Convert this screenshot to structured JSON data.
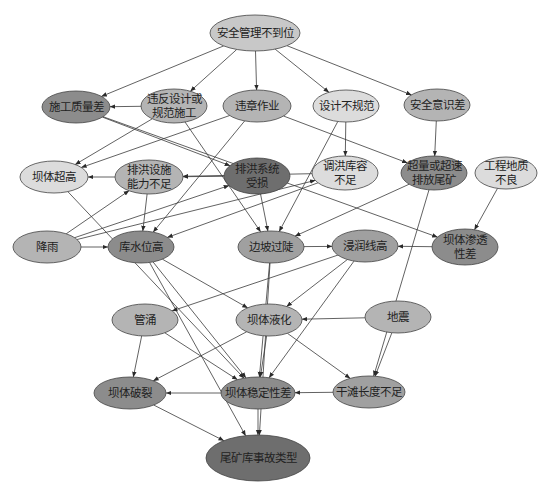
{
  "diagram": {
    "title": "",
    "colors": {
      "light": "#dcdcdc",
      "medium_light": "#c8c8c8",
      "medium": "#b4b4b4",
      "medium_dark": "#a0a0a0",
      "dark": "#8c8c8c",
      "darkest": "#6e6e6e",
      "edge": "#3a3a3a"
    },
    "nodes": [
      {
        "id": "n_safety_mgmt",
        "lines": [
          "安全管理不到位"
        ],
        "x": 255,
        "y": 33,
        "rx": 45,
        "ry": 18,
        "fill": "#c8c8c8"
      },
      {
        "id": "n_construction_quality",
        "lines": [
          "施工质量差"
        ],
        "x": 76,
        "y": 107,
        "rx": 34,
        "ry": 16,
        "fill": "#8c8c8c"
      },
      {
        "id": "n_violate_design",
        "lines": [
          "违反设计或",
          "规范施工"
        ],
        "x": 174,
        "y": 106,
        "rx": 33,
        "ry": 17,
        "fill": "#b4b4b4"
      },
      {
        "id": "n_illegal_ops",
        "lines": [
          "违章作业"
        ],
        "x": 257,
        "y": 106,
        "rx": 34,
        "ry": 16,
        "fill": "#b4b4b4"
      },
      {
        "id": "n_design_nonstandard",
        "lines": [
          "设计不规范"
        ],
        "x": 346,
        "y": 106,
        "rx": 33,
        "ry": 16,
        "fill": "#dcdcdc"
      },
      {
        "id": "n_safety_awareness",
        "lines": [
          "安全意识差"
        ],
        "x": 437,
        "y": 105,
        "rx": 33,
        "ry": 16,
        "fill": "#b4b4b4"
      },
      {
        "id": "n_dam_overheight",
        "lines": [
          "坝体超高"
        ],
        "x": 54,
        "y": 177,
        "rx": 34,
        "ry": 16,
        "fill": "#dcdcdc"
      },
      {
        "id": "n_drain_capacity",
        "lines": [
          "排洪设施",
          "能力不足"
        ],
        "x": 149,
        "y": 177,
        "rx": 34,
        "ry": 17,
        "fill": "#b4b4b4"
      },
      {
        "id": "n_drain_damaged",
        "lines": [
          "排洪系统",
          "受损"
        ],
        "x": 257,
        "y": 176,
        "rx": 33,
        "ry": 18,
        "fill": "#6e6e6e"
      },
      {
        "id": "n_flood_storage",
        "lines": [
          "调洪库容",
          "不足"
        ],
        "x": 345,
        "y": 173,
        "rx": 33,
        "ry": 17,
        "fill": "#dcdcdc"
      },
      {
        "id": "n_over_discharge",
        "lines": [
          "超量或超速",
          "排放尾矿"
        ],
        "x": 434,
        "y": 173,
        "rx": 33,
        "ry": 17,
        "fill": "#8c8c8c"
      },
      {
        "id": "n_poor_geology",
        "lines": [
          "工程地质",
          "不良"
        ],
        "x": 506,
        "y": 173,
        "rx": 31,
        "ry": 16,
        "fill": "#dcdcdc"
      },
      {
        "id": "n_rainfall",
        "lines": [
          "降雨"
        ],
        "x": 47,
        "y": 247,
        "rx": 34,
        "ry": 16,
        "fill": "#b4b4b4"
      },
      {
        "id": "n_high_water",
        "lines": [
          "库水位高"
        ],
        "x": 141,
        "y": 247,
        "rx": 33,
        "ry": 16,
        "fill": "#8c8c8c"
      },
      {
        "id": "n_steep_slope",
        "lines": [
          "边坡过陡"
        ],
        "x": 271,
        "y": 247,
        "rx": 33,
        "ry": 16,
        "fill": "#a0a0a0"
      },
      {
        "id": "n_high_phreatic",
        "lines": [
          "浸润线高"
        ],
        "x": 365,
        "y": 246,
        "rx": 33,
        "ry": 16,
        "fill": "#a0a0a0"
      },
      {
        "id": "n_poor_permeability",
        "lines": [
          "坝体渗透",
          "性差"
        ],
        "x": 465,
        "y": 247,
        "rx": 33,
        "ry": 18,
        "fill": "#8c8c8c"
      },
      {
        "id": "n_piping",
        "lines": [
          "管涌"
        ],
        "x": 145,
        "y": 320,
        "rx": 33,
        "ry": 16,
        "fill": "#b4b4b4"
      },
      {
        "id": "n_liquefaction",
        "lines": [
          "坝体液化"
        ],
        "x": 269,
        "y": 320,
        "rx": 33,
        "ry": 16,
        "fill": "#b4b4b4"
      },
      {
        "id": "n_earthquake",
        "lines": [
          "地震"
        ],
        "x": 398,
        "y": 317,
        "rx": 33,
        "ry": 16,
        "fill": "#b4b4b4"
      },
      {
        "id": "n_dam_crack",
        "lines": [
          "坝体破裂"
        ],
        "x": 130,
        "y": 393,
        "rx": 36,
        "ry": 16,
        "fill": "#8c8c8c"
      },
      {
        "id": "n_dam_instability",
        "lines": [
          "坝体稳定性差"
        ],
        "x": 258,
        "y": 393,
        "rx": 37,
        "ry": 16,
        "fill": "#8c8c8c"
      },
      {
        "id": "n_short_beach",
        "lines": [
          "干滩长度不足"
        ],
        "x": 369,
        "y": 392,
        "rx": 36,
        "ry": 16,
        "fill": "#a0a0a0"
      },
      {
        "id": "n_accident_type",
        "lines": [
          "尾矿库事故类型"
        ],
        "x": 258,
        "y": 458,
        "rx": 52,
        "ry": 23,
        "fill": "#6e6e6e"
      }
    ],
    "edges": [
      [
        "n_safety_mgmt",
        "n_construction_quality"
      ],
      [
        "n_safety_mgmt",
        "n_violate_design"
      ],
      [
        "n_safety_mgmt",
        "n_illegal_ops"
      ],
      [
        "n_safety_mgmt",
        "n_design_nonstandard"
      ],
      [
        "n_safety_mgmt",
        "n_safety_awareness"
      ],
      [
        "n_violate_design",
        "n_construction_quality"
      ],
      [
        "n_violate_design",
        "n_dam_overheight"
      ],
      [
        "n_violate_design",
        "n_steep_slope"
      ],
      [
        "n_illegal_ops",
        "n_dam_overheight"
      ],
      [
        "n_illegal_ops",
        "n_high_water"
      ],
      [
        "n_illegal_ops",
        "n_over_discharge"
      ],
      [
        "n_construction_quality",
        "n_drain_damaged"
      ],
      [
        "n_construction_quality",
        "n_poor_permeability"
      ],
      [
        "n_design_nonstandard",
        "n_flood_storage"
      ],
      [
        "n_design_nonstandard",
        "n_steep_slope"
      ],
      [
        "n_safety_awareness",
        "n_over_discharge"
      ],
      [
        "n_drain_capacity",
        "n_dam_overheight"
      ],
      [
        "n_drain_capacity",
        "n_high_water"
      ],
      [
        "n_drain_damaged",
        "n_drain_capacity"
      ],
      [
        "n_drain_damaged",
        "n_steep_slope"
      ],
      [
        "n_flood_storage",
        "n_drain_capacity"
      ],
      [
        "n_flood_storage",
        "n_high_water"
      ],
      [
        "n_over_discharge",
        "n_steep_slope"
      ],
      [
        "n_over_discharge",
        "n_short_beach"
      ],
      [
        "n_poor_geology",
        "n_poor_permeability"
      ],
      [
        "n_rainfall",
        "n_high_water"
      ],
      [
        "n_rainfall",
        "n_drain_capacity"
      ],
      [
        "n_rainfall",
        "n_drain_damaged"
      ],
      [
        "n_rainfall",
        "n_flood_storage"
      ],
      [
        "n_dam_overheight",
        "n_dam_instability"
      ],
      [
        "n_high_water",
        "n_dam_instability"
      ],
      [
        "n_high_water",
        "n_accident_type"
      ],
      [
        "n_high_water",
        "n_liquefaction"
      ],
      [
        "n_steep_slope",
        "n_high_phreatic"
      ],
      [
        "n_steep_slope",
        "n_dam_instability"
      ],
      [
        "n_steep_slope",
        "n_accident_type"
      ],
      [
        "n_poor_permeability",
        "n_high_phreatic"
      ],
      [
        "n_high_phreatic",
        "n_piping"
      ],
      [
        "n_high_phreatic",
        "n_liquefaction"
      ],
      [
        "n_high_phreatic",
        "n_dam_instability"
      ],
      [
        "n_piping",
        "n_dam_crack"
      ],
      [
        "n_piping",
        "n_dam_instability"
      ],
      [
        "n_liquefaction",
        "n_dam_crack"
      ],
      [
        "n_liquefaction",
        "n_dam_instability"
      ],
      [
        "n_liquefaction",
        "n_short_beach"
      ],
      [
        "n_earthquake",
        "n_liquefaction"
      ],
      [
        "n_earthquake",
        "n_short_beach"
      ],
      [
        "n_short_beach",
        "n_dam_instability"
      ],
      [
        "n_dam_instability",
        "n_dam_crack"
      ],
      [
        "n_dam_crack",
        "n_accident_type"
      ],
      [
        "n_dam_instability",
        "n_accident_type"
      ]
    ]
  }
}
